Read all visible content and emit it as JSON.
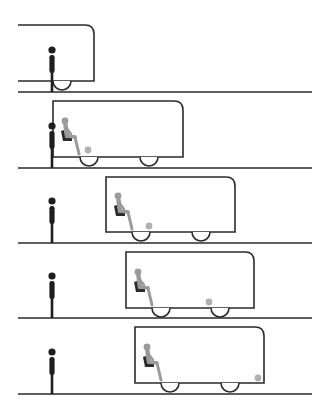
{
  "diagram": {
    "colors": {
      "line": "#2a2a2a",
      "standing_person": "#1e1e1e",
      "seated_person": "#9a9a9a",
      "seat": "#2a2a2a",
      "ball": "#b0b0b0",
      "background": "#ffffff"
    },
    "panels": [
      {
        "id": 1,
        "ground_y": 92,
        "bus": {
          "left": 18,
          "right": 94,
          "top": 25,
          "bottom": 81,
          "clip_left": true
        },
        "wheels": [
          62
        ],
        "person_x": 52,
        "passenger_visible": false,
        "ball": null
      },
      {
        "id": 2,
        "ground_y": 168,
        "bus": {
          "left": 53,
          "right": 183,
          "top": 101,
          "bottom": 157
        },
        "wheels": [
          89,
          149
        ],
        "person_x": 52,
        "passenger_visible": true,
        "ball": {
          "x": 88,
          "y": 150
        }
      },
      {
        "id": 3,
        "ground_y": 243,
        "bus": {
          "left": 106,
          "right": 235,
          "top": 177,
          "bottom": 232
        },
        "wheels": [
          141,
          201
        ],
        "person_x": 52,
        "passenger_visible": true,
        "ball": {
          "x": 149,
          "y": 226
        }
      },
      {
        "id": 4,
        "ground_y": 318,
        "bus": {
          "left": 126,
          "right": 254,
          "top": 252,
          "bottom": 308
        },
        "wheels": [
          161,
          220
        ],
        "person_x": 52,
        "passenger_visible": true,
        "ball": {
          "x": 209,
          "y": 302
        }
      },
      {
        "id": 5,
        "ground_y": 394,
        "bus": {
          "left": 135,
          "right": 264,
          "top": 327,
          "bottom": 383
        },
        "wheels": [
          170,
          230
        ],
        "person_x": 52,
        "passenger_visible": true,
        "ball": {
          "x": 258,
          "y": 378
        }
      }
    ]
  }
}
